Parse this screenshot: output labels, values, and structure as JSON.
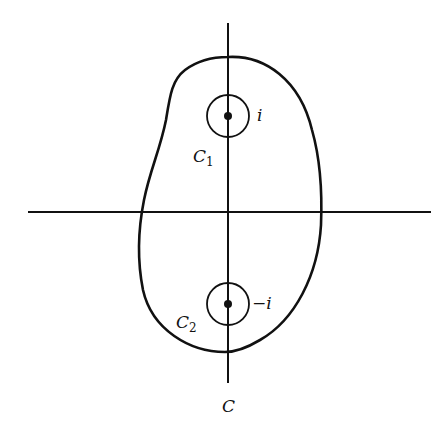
{
  "figure": {
    "background": "#ffffff",
    "stroke": "#111111",
    "axes": {
      "horizontal": {
        "x1": 28,
        "x2": 431,
        "y": 212
      },
      "vertical": {
        "x": 228,
        "y1": 23,
        "y2": 383
      }
    },
    "contour": {
      "label": "C",
      "label_pos": {
        "x": 222,
        "y": 412
      }
    },
    "small_circles": [
      {
        "name": "C1",
        "label": "C",
        "subscript": "1",
        "center": {
          "x": 228,
          "y": 116
        },
        "radius": 21,
        "pole_label": "i",
        "pole_label_pos": {
          "x": 257,
          "y": 121
        },
        "circle_label_pos": {
          "x": 193,
          "y": 162
        }
      },
      {
        "name": "C2",
        "label": "C",
        "subscript": "2",
        "center": {
          "x": 228,
          "y": 304
        },
        "radius": 21,
        "pole_label": "−i",
        "pole_label_pos": {
          "x": 252,
          "y": 309
        },
        "circle_label_pos": {
          "x": 176,
          "y": 328
        }
      }
    ]
  }
}
